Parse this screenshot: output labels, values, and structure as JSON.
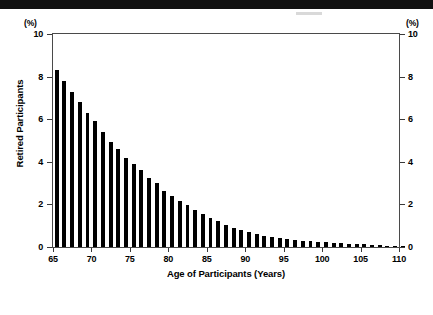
{
  "chart_data": {
    "type": "bar",
    "title": "",
    "xlabel": "Age of Participants (Years)",
    "ylabel": "Retired Participants",
    "unit_label_left": "(%)",
    "unit_label_right": "(%)",
    "xlim": [
      65,
      110
    ],
    "ylim": [
      0,
      10
    ],
    "grid": false,
    "legend": null,
    "bar_color": "#000000",
    "frame_color": "#4a4a4a",
    "x_ticks": [
      65,
      70,
      75,
      80,
      85,
      90,
      95,
      100,
      105,
      110
    ],
    "x_tick_labels": [
      "65",
      "70",
      "75",
      "80",
      "85",
      "90",
      "95",
      "100",
      "105",
      "110"
    ],
    "y_ticks": [
      0,
      2,
      4,
      6,
      8,
      10
    ],
    "y_tick_labels": [
      "0",
      "2",
      "4",
      "6",
      "8",
      "10"
    ],
    "y_tick_labels_right": [
      "0",
      "2",
      "4",
      "6",
      "8",
      "10"
    ],
    "categories": [
      65,
      66,
      67,
      68,
      69,
      70,
      71,
      72,
      73,
      74,
      75,
      76,
      77,
      78,
      79,
      80,
      81,
      82,
      83,
      84,
      85,
      86,
      87,
      88,
      89,
      90,
      91,
      92,
      93,
      94,
      95,
      96,
      97,
      98,
      99,
      100,
      101,
      102,
      103,
      104,
      105,
      106,
      107,
      108,
      109,
      110
    ],
    "values": [
      8.3,
      7.8,
      7.3,
      6.8,
      6.3,
      5.9,
      5.4,
      4.95,
      4.6,
      4.2,
      3.9,
      3.6,
      3.25,
      3.0,
      2.65,
      2.4,
      2.15,
      1.95,
      1.75,
      1.55,
      1.35,
      1.2,
      1.05,
      0.9,
      0.8,
      0.7,
      0.62,
      0.54,
      0.47,
      0.42,
      0.37,
      0.33,
      0.3,
      0.27,
      0.24,
      0.22,
      0.2,
      0.18,
      0.16,
      0.14,
      0.12,
      0.1,
      0.09,
      0.07,
      0.05,
      0.03
    ]
  }
}
